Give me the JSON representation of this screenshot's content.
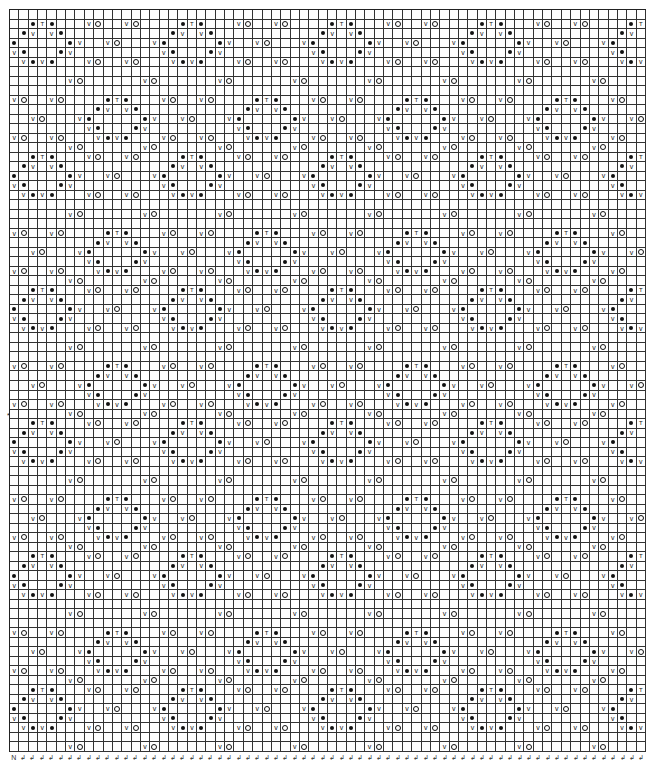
{
  "chart": {
    "columns": 68,
    "rows": 78,
    "repeat": {
      "width": 16,
      "height": 14
    },
    "legend_symbols": {
      "dot": "filled-circle-stitch",
      "V": "slip-stitch",
      "O": "yarn-over",
      "T": "decrease-stitch"
    },
    "tile_rows": [
      {
        "row": 0,
        "cells": [
          [
            6,
            "V"
          ],
          [
            7,
            "O"
          ],
          [
            14,
            "V"
          ],
          [
            15,
            "O"
          ]
        ]
      },
      {
        "row": 1,
        "cells": [
          [
            2,
            "dot"
          ],
          [
            3,
            "T"
          ],
          [
            4,
            "dot"
          ],
          [
            8,
            "V"
          ],
          [
            9,
            "O"
          ],
          [
            12,
            "V"
          ],
          [
            13,
            "O"
          ]
        ]
      },
      {
        "row": 2,
        "cells": [
          [
            1,
            "dot"
          ],
          [
            2,
            "V"
          ],
          [
            4,
            "V"
          ],
          [
            5,
            "dot"
          ]
        ]
      },
      {
        "row": 3,
        "cells": [
          [
            0,
            "dot"
          ],
          [
            6,
            "dot"
          ],
          [
            7,
            "V"
          ],
          [
            10,
            "V"
          ],
          [
            11,
            "O"
          ],
          [
            15,
            "V"
          ]
        ]
      },
      {
        "row": 4,
        "cells": [
          [
            0,
            "V"
          ],
          [
            1,
            "dot"
          ],
          [
            5,
            "dot"
          ],
          [
            6,
            "V"
          ]
        ]
      },
      {
        "row": 5,
        "cells": [
          [
            1,
            "V"
          ],
          [
            2,
            "dot"
          ],
          [
            3,
            "V"
          ],
          [
            4,
            "dot"
          ],
          [
            8,
            "V"
          ],
          [
            9,
            "O"
          ],
          [
            12,
            "V"
          ],
          [
            13,
            "O"
          ]
        ]
      },
      {
        "row": 6,
        "cells": []
      },
      {
        "row": 7,
        "cells": [
          [
            6,
            "V"
          ],
          [
            7,
            "O"
          ],
          [
            14,
            "V"
          ],
          [
            15,
            "O"
          ]
        ]
      },
      {
        "row": 8,
        "cells": []
      },
      {
        "row": 9,
        "cells": [
          [
            0,
            "V"
          ],
          [
            1,
            "O"
          ],
          [
            4,
            "V"
          ],
          [
            5,
            "O"
          ],
          [
            10,
            "dot"
          ],
          [
            11,
            "T"
          ],
          [
            12,
            "dot"
          ]
        ]
      },
      {
        "row": 10,
        "cells": [
          [
            9,
            "dot"
          ],
          [
            10,
            "V"
          ],
          [
            12,
            "V"
          ],
          [
            13,
            "dot"
          ]
        ]
      },
      {
        "row": 11,
        "cells": [
          [
            2,
            "V"
          ],
          [
            3,
            "O"
          ],
          [
            7,
            "V"
          ],
          [
            8,
            "dot"
          ],
          [
            14,
            "dot"
          ],
          [
            15,
            "V"
          ]
        ]
      },
      {
        "row": 12,
        "cells": [
          [
            8,
            "V"
          ],
          [
            9,
            "dot"
          ],
          [
            13,
            "dot"
          ],
          [
            14,
            "V"
          ]
        ]
      },
      {
        "row": 13,
        "cells": [
          [
            0,
            "V"
          ],
          [
            1,
            "O"
          ],
          [
            4,
            "V"
          ],
          [
            5,
            "O"
          ],
          [
            9,
            "V"
          ],
          [
            10,
            "dot"
          ],
          [
            11,
            "V"
          ],
          [
            12,
            "dot"
          ]
        ]
      }
    ],
    "first_row_blank": true,
    "row_marker": {
      "row": 42,
      "symbol": "*"
    }
  },
  "footer": {
    "first_symbol": "N",
    "repeat_symbol": "↲"
  }
}
